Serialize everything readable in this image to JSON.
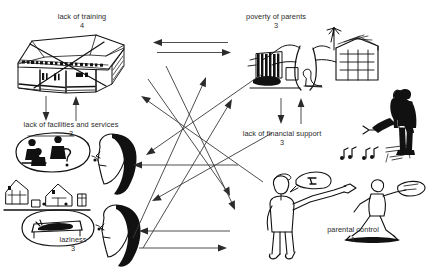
{
  "diagram": {
    "type": "hand-drawn causal problem tree",
    "nodes": [
      {
        "id": "lack-of-training",
        "label": "lack of training",
        "score": "4",
        "illustration": "crossed-out-school-building-sketch"
      },
      {
        "id": "poverty-of-parents",
        "label": "poverty of parents",
        "score": "3",
        "illustration": "rural-homestead-with-tree-and-hut-sketch"
      },
      {
        "id": "lack-of-facilities-and-services",
        "label": "lack of facilities and services",
        "score": "3",
        "illustration": "woman-thinking-of-village-scene-sketch"
      },
      {
        "id": "lack-of-financial-support",
        "label": "lack of financial support",
        "score": "3",
        "illustration": "standing-man-and-seated-woman-sketch"
      },
      {
        "id": "laziness",
        "label": "laziness",
        "score": "3",
        "illustration": "woman-thinking-of-person-on-bed-sketch"
      },
      {
        "id": "parental-control",
        "label": "parental control",
        "score": "1",
        "illustration": "adult-scolding-running-child-sketch"
      }
    ],
    "connectors": [
      {
        "id": "top-pair-leftward",
        "kind": "horizontal-arrow",
        "direction": "left"
      },
      {
        "id": "top-pair-rightward",
        "kind": "horizontal-arrow",
        "direction": "right"
      },
      {
        "id": "house-down",
        "kind": "vertical-arrow",
        "direction": "down"
      },
      {
        "id": "house-up",
        "kind": "vertical-arrow",
        "direction": "up"
      },
      {
        "id": "poverty-down",
        "kind": "vertical-arrow",
        "direction": "down"
      },
      {
        "id": "poverty-up",
        "kind": "vertical-arrow",
        "direction": "up"
      },
      {
        "id": "mid-horizontal-left",
        "kind": "horizontal-arrow",
        "direction": "left"
      },
      {
        "id": "bottom-horizontal-left",
        "kind": "horizontal-arrow",
        "direction": "left"
      },
      {
        "id": "bottom-horizontal-right",
        "kind": "horizontal-arrow",
        "direction": "right"
      },
      {
        "id": "diagonal-up-right-1",
        "kind": "diagonal-arrow",
        "direction": "up-right"
      },
      {
        "id": "diagonal-up-right-2",
        "kind": "diagonal-arrow",
        "direction": "up-right"
      },
      {
        "id": "diagonal-up-left-1",
        "kind": "diagonal-arrow",
        "direction": "up-left"
      },
      {
        "id": "diagonal-down-left-1",
        "kind": "diagonal-arrow",
        "direction": "down-left"
      },
      {
        "id": "diagonal-down-left-2",
        "kind": "diagonal-arrow",
        "direction": "down-left"
      },
      {
        "id": "diagonal-down-right-1",
        "kind": "diagonal-arrow",
        "direction": "down-right"
      },
      {
        "id": "diagonal-down-right-2",
        "kind": "diagonal-arrow",
        "direction": "down-right"
      }
    ],
    "colors": {
      "background": "#ffffff",
      "ink": "#111111",
      "arrow": "#3a3a3a",
      "text": "#2a2a2a"
    }
  }
}
